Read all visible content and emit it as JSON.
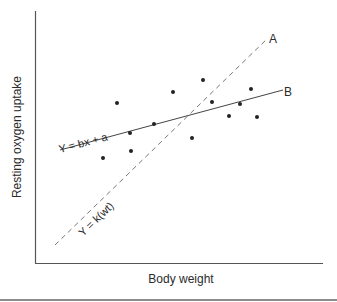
{
  "figure": {
    "x_axis_label": "Body weight",
    "y_axis_label": "Resting oxygen uptake",
    "line_a": {
      "label": "A",
      "equation": "Y = k(wt)",
      "style": "dashed"
    },
    "line_b": {
      "label": "B",
      "equation": "Y = bx + a",
      "style": "solid"
    }
  },
  "chart_data": {
    "type": "scatter",
    "title": "",
    "xlabel": "Body weight",
    "ylabel": "Resting oxygen uptake",
    "ticks": "none",
    "grid": false,
    "points_px": [
      [
        117,
        103
      ],
      [
        130,
        133
      ],
      [
        103,
        158
      ],
      [
        131,
        151
      ],
      [
        154,
        124
      ],
      [
        173,
        92
      ],
      [
        203,
        80
      ],
      [
        212,
        102
      ],
      [
        192,
        138
      ],
      [
        229,
        116
      ],
      [
        240,
        104
      ],
      [
        251,
        89
      ],
      [
        257,
        117
      ]
    ],
    "lines": [
      {
        "name": "A",
        "equation": "Y = k(wt)",
        "style": "dashed",
        "from_px": [
          55,
          245
        ],
        "to_px": [
          268,
          38
        ]
      },
      {
        "name": "B",
        "equation": "Y = bx + a",
        "style": "solid",
        "from_px": [
          60,
          150
        ],
        "to_px": [
          283,
          90
        ]
      }
    ]
  }
}
